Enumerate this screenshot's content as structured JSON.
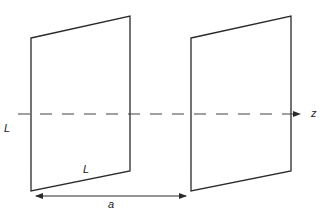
{
  "diagram": {
    "colors": {
      "stroke": "#2a2a2a",
      "axis": "#444444",
      "background": "#ffffff"
    },
    "plates": [
      {
        "name": "left-plate",
        "points": "31,38 130,16 130,171 31,191"
      },
      {
        "name": "right-plate",
        "points": "191,38 291,16 291,171 191,191"
      }
    ],
    "axis": {
      "x1": 18,
      "y1": 114,
      "x2": 300,
      "y2": 114,
      "label": "z"
    },
    "separation": {
      "x1": 36,
      "y1": 196,
      "x2": 186,
      "y2": 196,
      "label": "a"
    },
    "labels": {
      "side_height": "L",
      "side_width": "L",
      "separation": "a",
      "axis": "z"
    }
  }
}
